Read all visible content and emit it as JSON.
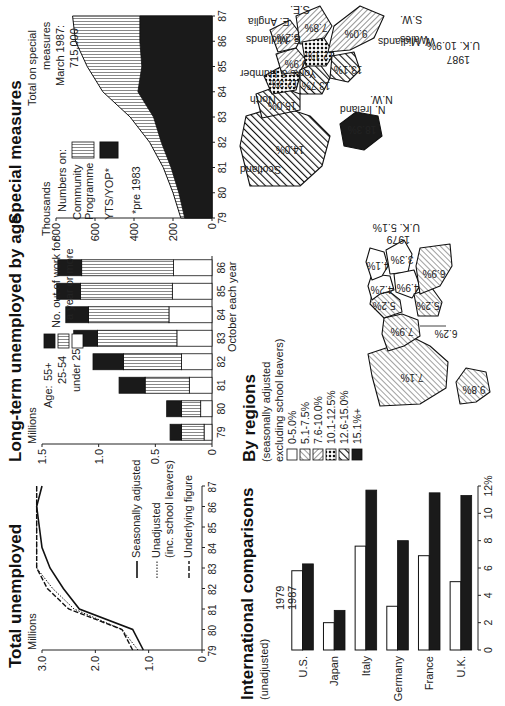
{
  "total_unemployed": {
    "title": "Total unemployed",
    "unit": "Millions",
    "legend": [
      "Seasonally adjusted",
      "Unadjusted",
      "(inc. school leavers)",
      "Underlying figure"
    ]
  },
  "long_term": {
    "title": "Long-term unemployed by age",
    "unit": "Millions",
    "legend_title": "Age:",
    "legend": [
      "55+",
      "25-54",
      "under 25"
    ],
    "note": [
      "No. out of work for",
      "a year or more"
    ],
    "xlabel": "October each year"
  },
  "special_measures": {
    "title": "Special measures",
    "unit": "Thousands",
    "numbers_on": "Numbers on:",
    "legend": [
      "Community",
      "Programme",
      "YTS/YOP*"
    ],
    "footnote": "*pre 1983",
    "total_note": [
      "Total on special",
      "measures",
      "March 1987:",
      "715,000"
    ]
  },
  "international": {
    "title": "International comparisons",
    "subtitle": "(unadjusted)",
    "legend": [
      "1979",
      "1987"
    ]
  },
  "regions": {
    "title": "By regions",
    "subtitle": [
      "(seasonally adjusted",
      "excluding school leavers)"
    ],
    "bands": [
      "0-5.0%",
      "5.1-7.5%",
      "7.6-10.0%",
      "10.1-12.5%",
      "12.6-15.0%",
      "15.1%+"
    ],
    "map1979": {
      "year": "1979",
      "uk": "U.K. 5.1%",
      "values": [
        "7.1%",
        "7.9%",
        "5.2%",
        "4.2%",
        "4.1%",
        "3.3%",
        "4.9%",
        "6.2%",
        "6.9%",
        "5.2%",
        "9.8%"
      ]
    },
    "map1987": {
      "year": "1987",
      "uk": "U.K. 10.9%",
      "labels": [
        "Scotland",
        "North",
        "Yorks & Humber",
        "E. Midlands",
        "E. Anglia",
        "S.E.",
        "N. Ireland",
        "N.W.",
        "W. Midlands",
        "Wales",
        "S.W."
      ],
      "values": [
        "14.0%",
        "15.0%",
        "12.3%",
        "9.9%",
        "8.2%",
        "7.8%",
        "18.3%",
        "13.7%",
        "12.1%",
        "13.1%",
        "9.0%"
      ]
    }
  },
  "chart_data": [
    {
      "type": "line",
      "title": "Total unemployed",
      "ylabel": "Millions",
      "x": [
        "79",
        "80",
        "81",
        "82",
        "83",
        "84",
        "85",
        "86",
        "87"
      ],
      "ylim": [
        0,
        3.0
      ],
      "yticks": [
        0,
        1.0,
        2.0,
        3.0
      ],
      "series": [
        {
          "name": "Seasonally adjusted",
          "values": [
            1.1,
            1.3,
            2.3,
            2.6,
            2.85,
            3.0,
            3.05,
            3.15,
            3.0
          ]
        },
        {
          "name": "Unadjusted (inc. school leavers)",
          "values": [
            1.2,
            1.5,
            2.4,
            2.8,
            3.1,
            3.1,
            3.2,
            3.25,
            3.1
          ]
        },
        {
          "name": "Underlying figure",
          "values": [
            1.3,
            1.5,
            2.5,
            2.9,
            3.1,
            3.2,
            3.3,
            3.3,
            3.2
          ]
        }
      ]
    },
    {
      "type": "bar",
      "stacked": true,
      "title": "Long-term unemployed by age",
      "ylabel": "Millions",
      "xlabel": "October each year",
      "categories": [
        "79",
        "80",
        "81",
        "82",
        "83",
        "84",
        "85",
        "86"
      ],
      "ylim": [
        0,
        1.5
      ],
      "yticks": [
        0,
        0.5,
        1.0,
        1.5
      ],
      "series": [
        {
          "name": "under 25",
          "values": [
            0.07,
            0.1,
            0.2,
            0.27,
            0.31,
            0.38,
            0.35,
            0.34
          ]
        },
        {
          "name": "25-54",
          "values": [
            0.2,
            0.17,
            0.39,
            0.51,
            0.7,
            0.71,
            0.81,
            0.81
          ]
        },
        {
          "name": "55+",
          "values": [
            0.1,
            0.13,
            0.23,
            0.27,
            0.21,
            0.2,
            0.21,
            0.21
          ]
        }
      ]
    },
    {
      "type": "area",
      "stacked": true,
      "title": "Special measures",
      "ylabel": "Thousands",
      "x": [
        "79",
        "80",
        "81",
        "82",
        "83",
        "84",
        "85",
        "86",
        "87"
      ],
      "ylim": [
        0,
        800
      ],
      "yticks": [
        0,
        200,
        400,
        600,
        800
      ],
      "series": [
        {
          "name": "YTS/YOP*",
          "values": [
            140,
            170,
            210,
            260,
            300,
            380,
            360,
            370,
            370
          ]
        },
        {
          "name": "Community Programme",
          "values": [
            20,
            30,
            40,
            60,
            120,
            180,
            280,
            330,
            345
          ]
        }
      ],
      "annotation": "Total on special measures March 1987: 715,000"
    },
    {
      "type": "bar",
      "title": "International comparisons (unadjusted)",
      "categories": [
        "U.S.",
        "Japan",
        "Italy",
        "Germany",
        "France",
        "U.K."
      ],
      "xlim": [
        0,
        12
      ],
      "xticks": [
        0,
        2,
        4,
        6,
        8,
        10,
        12
      ],
      "series": [
        {
          "name": "1979",
          "values": [
            5.8,
            2.0,
            7.6,
            3.2,
            6.9,
            5.0
          ]
        },
        {
          "name": "1987",
          "values": [
            6.3,
            2.9,
            11.7,
            8.0,
            11.5,
            11.3
          ]
        }
      ]
    }
  ]
}
